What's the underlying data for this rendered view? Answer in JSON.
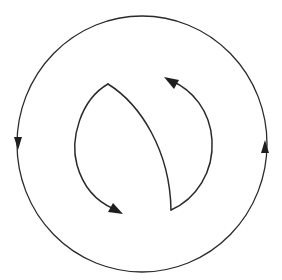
{
  "diagram": {
    "type": "circulation-flow",
    "colors": {
      "background": "#ffffff",
      "line": "#2a2a2a",
      "arrowhead": "#1e1e1e"
    },
    "elements": [
      {
        "id": "outer-loop",
        "shape": "circle",
        "arrows": [
          {
            "position": "left",
            "direction": "down"
          },
          {
            "position": "right",
            "direction": "up"
          }
        ]
      },
      {
        "id": "inner-divider",
        "shape": "curve",
        "from": "top-cusp",
        "to": "bottom-cusp"
      },
      {
        "id": "left-arc",
        "shape": "arc",
        "from": "top-cusp",
        "arrow": {
          "position": "end",
          "direction": "down-right"
        }
      },
      {
        "id": "right-arc",
        "shape": "arc",
        "from": "bottom-cusp",
        "arrow": {
          "position": "end",
          "direction": "up-left"
        }
      }
    ],
    "labels": []
  }
}
